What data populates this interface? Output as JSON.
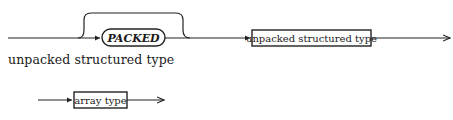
{
  "diagram1": {
    "keyword": "PACKED",
    "nonterminal": "unpacked structured type"
  },
  "caption": "unpacked structured type",
  "diagram2": {
    "nonterminal": "array type"
  },
  "colors": {
    "line": "#222222",
    "background": "#ffffff"
  }
}
